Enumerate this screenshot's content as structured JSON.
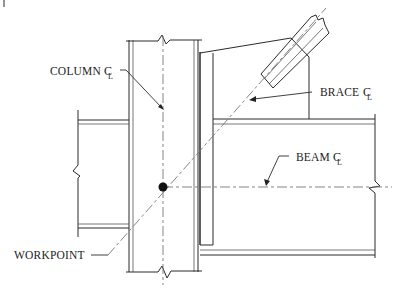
{
  "diagram": {
    "type": "structural steel braced connection detail",
    "labels": {
      "column_cl": "COLUMN",
      "brace_cl": "BRACE",
      "beam_cl": "BEAM",
      "workpoint": "WORKPOINT",
      "centerline_symbol": "C",
      "centerline_sub": "L"
    },
    "elements": [
      {
        "name": "column",
        "orientation": "vertical",
        "has_break_lines": true
      },
      {
        "name": "left-beam",
        "orientation": "horizontal",
        "has_break_line": true
      },
      {
        "name": "right-beam",
        "orientation": "horizontal",
        "has_break_line": true
      },
      {
        "name": "gusset-plate"
      },
      {
        "name": "brace",
        "orientation": "diagonal",
        "has_break_line": true
      },
      {
        "name": "workpoint",
        "shape": "filled-circle"
      }
    ],
    "colors": {
      "line": "#2a2a2a",
      "centerline": "#777777",
      "background": "#ffffff"
    }
  }
}
